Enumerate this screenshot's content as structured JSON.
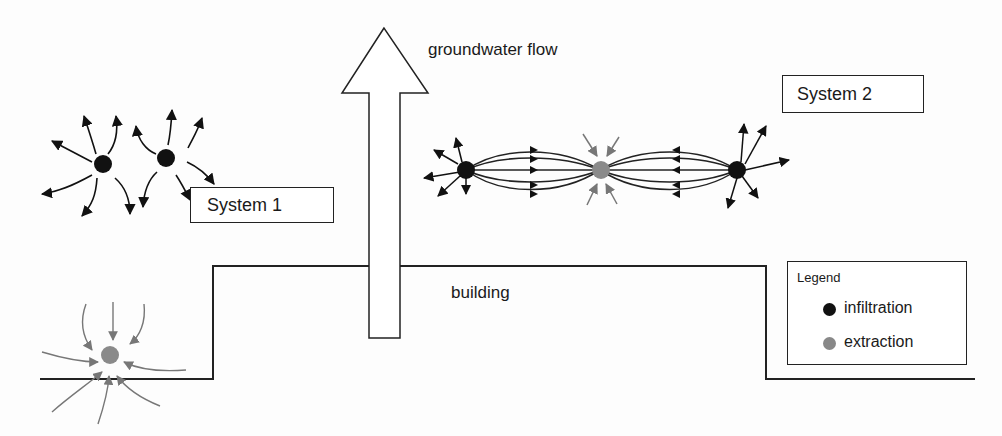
{
  "labels": {
    "groundwater_flow": "groundwater flow",
    "building": "building",
    "system1": "System 1",
    "system2": "System 2"
  },
  "legend": {
    "title": "Legend",
    "items": [
      {
        "label": "infiltration",
        "color": "#111111"
      },
      {
        "label": "extraction",
        "color": "#888888"
      }
    ]
  },
  "colors": {
    "infiltration": "#111111",
    "extraction": "#888888",
    "line": "#222222"
  }
}
